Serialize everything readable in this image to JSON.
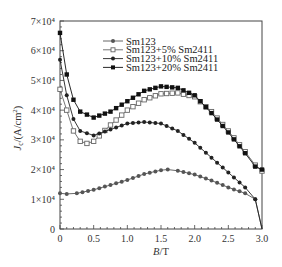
{
  "chart_data": {
    "type": "line",
    "title": "",
    "xlabel": "B/T",
    "ylabel": "J_c/(A/cm²)",
    "xlim": [
      0,
      3.0
    ],
    "ylim": [
      0,
      70000
    ],
    "grid": false,
    "legend_position": "upper-center",
    "x_ticks": [
      0,
      0.5,
      1.0,
      1.5,
      2.0,
      2.5,
      3.0
    ],
    "x_tick_labels": [
      "0",
      "0.5",
      "1.0",
      "1.5",
      "2.0",
      "2.5",
      "3.0"
    ],
    "y_ticks": [
      0,
      10000,
      20000,
      30000,
      40000,
      50000,
      60000,
      70000
    ],
    "y_tick_labels": [
      "0",
      "1×10⁴",
      "2×10⁴",
      "3×10⁴",
      "4×10⁴",
      "5×10⁴",
      "6×10⁴",
      "7×10⁴"
    ],
    "series": [
      {
        "name": "Sm123",
        "marker": "filled-circle",
        "color": "#555555",
        "x": [
          0,
          0.1,
          0.25,
          0.5,
          0.75,
          1.0,
          1.25,
          1.5,
          1.6,
          1.75,
          2.0,
          2.25,
          2.5,
          2.75,
          2.9,
          3.0
        ],
        "values": [
          12000,
          11800,
          12000,
          13200,
          14800,
          16500,
          18500,
          19800,
          20000,
          19600,
          18300,
          16300,
          14000,
          12000,
          10000,
          0
        ]
      },
      {
        "name": "Sm123+5% Sm2411",
        "marker": "open-square",
        "color": "#666666",
        "x": [
          0,
          0.1,
          0.2,
          0.3,
          0.4,
          0.5,
          0.75,
          1.0,
          1.25,
          1.5,
          1.75,
          2.0,
          2.25,
          2.5,
          2.75,
          2.9,
          3.0
        ],
        "values": [
          47000,
          40000,
          33000,
          29500,
          28800,
          29500,
          35000,
          40000,
          43500,
          45500,
          45800,
          44500,
          39500,
          33000,
          26000,
          21500,
          19500
        ]
      },
      {
        "name": "Sm123+10% Sm2411",
        "marker": "filled-circle",
        "color": "#222222",
        "x": [
          0,
          0.1,
          0.2,
          0.3,
          0.5,
          0.75,
          1.0,
          1.25,
          1.5,
          1.75,
          2.0,
          2.25,
          2.5,
          2.75,
          2.9,
          3.0
        ],
        "values": [
          57000,
          45000,
          37000,
          33000,
          31500,
          33500,
          35500,
          36000,
          35500,
          33000,
          29000,
          24000,
          19000,
          14000,
          10000,
          0
        ]
      },
      {
        "name": "Sm123+20% Sm2411",
        "marker": "filled-square",
        "color": "#111111",
        "x": [
          0,
          0.1,
          0.2,
          0.3,
          0.5,
          0.75,
          1.0,
          1.25,
          1.5,
          1.75,
          2.0,
          2.25,
          2.5,
          2.75,
          2.9,
          3.0
        ],
        "values": [
          66000,
          52000,
          43500,
          39500,
          37500,
          39500,
          43000,
          46500,
          48000,
          47500,
          45000,
          39000,
          32500,
          25500,
          21000,
          20000
        ]
      }
    ]
  },
  "legend": {
    "items": [
      {
        "label": "Sm123"
      },
      {
        "label": "Sm123+5% Sm2411"
      },
      {
        "label": "Sm123+10% Sm2411"
      },
      {
        "label": "Sm123+20% Sm2411"
      }
    ]
  },
  "axes": {
    "x_title_italic": "B",
    "x_title_rest": "/T",
    "y_title_italic": "J",
    "y_title_sub": "c",
    "y_title_rest": "/(A/cm",
    "y_title_sup": "2",
    "y_title_close": ")"
  }
}
